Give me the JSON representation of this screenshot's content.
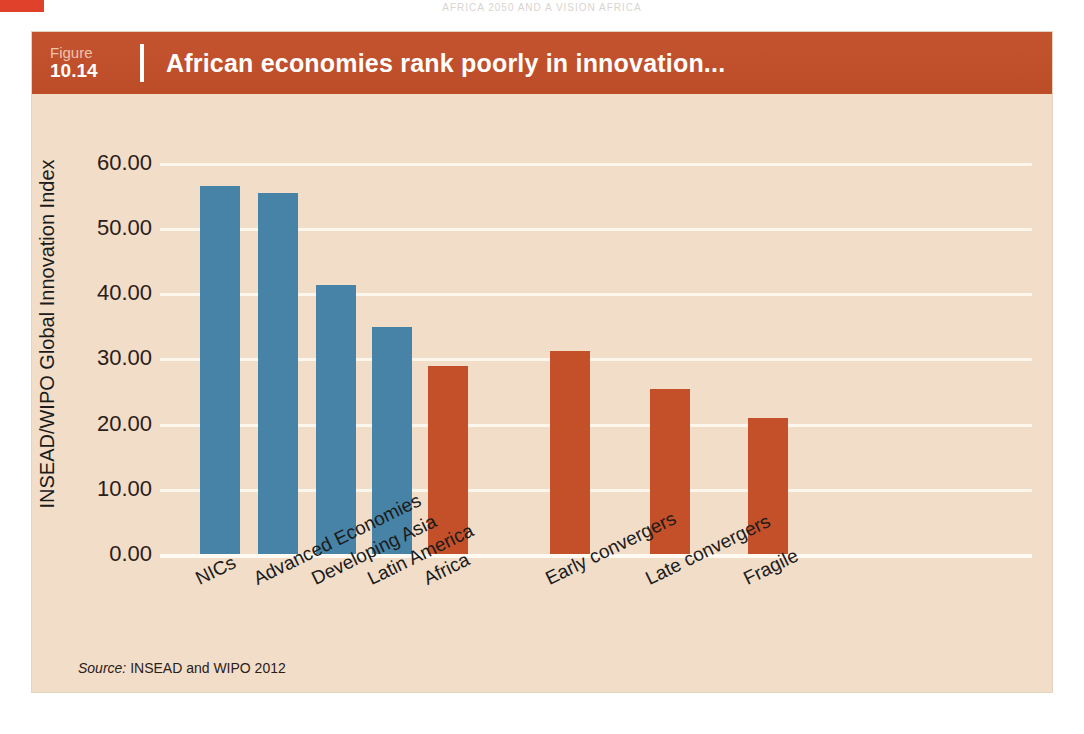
{
  "page": {
    "running_head": "AFRICA 2050 AND A VISION AFRICA",
    "corner_mark": ""
  },
  "figure": {
    "number_word": "Figure",
    "number": "10.14",
    "title": "African economies rank poorly in innovation...",
    "source_label": "Source:",
    "source_text": " INSEAD and WIPO 2012"
  },
  "colors": {
    "header_band": "#c0502c",
    "panel_background": "#f2ddc8",
    "bar_blue": "#4683a6",
    "bar_red": "#c4502a",
    "gridline": "#fdf6ec"
  },
  "chart_data": {
    "type": "bar",
    "title": "African economies rank poorly in innovation...",
    "xlabel": "",
    "ylabel": "INSEAD/WIPO Global Innovation Index",
    "ylim": [
      0,
      60
    ],
    "ytick_labels": [
      "60.00",
      "50.00",
      "40.00",
      "30.00",
      "20.00",
      "10.00",
      "0.00"
    ],
    "ytick_values": [
      60,
      50,
      40,
      30,
      20,
      10,
      0
    ],
    "grid": true,
    "legend": "none",
    "categories": [
      "NICs",
      "Advanced Economies",
      "Developing Asia",
      "Latin America",
      "Africa",
      "Early convergers",
      "Late convergers",
      "Fragile"
    ],
    "values": [
      56.5,
      55.4,
      41.2,
      34.8,
      28.8,
      31.2,
      25.3,
      20.9
    ],
    "bar_colors": [
      "#4683a6",
      "#4683a6",
      "#4683a6",
      "#4683a6",
      "#c4502a",
      "#c4502a",
      "#c4502a",
      "#c4502a"
    ],
    "source": "Source: INSEAD and WIPO 2012"
  }
}
